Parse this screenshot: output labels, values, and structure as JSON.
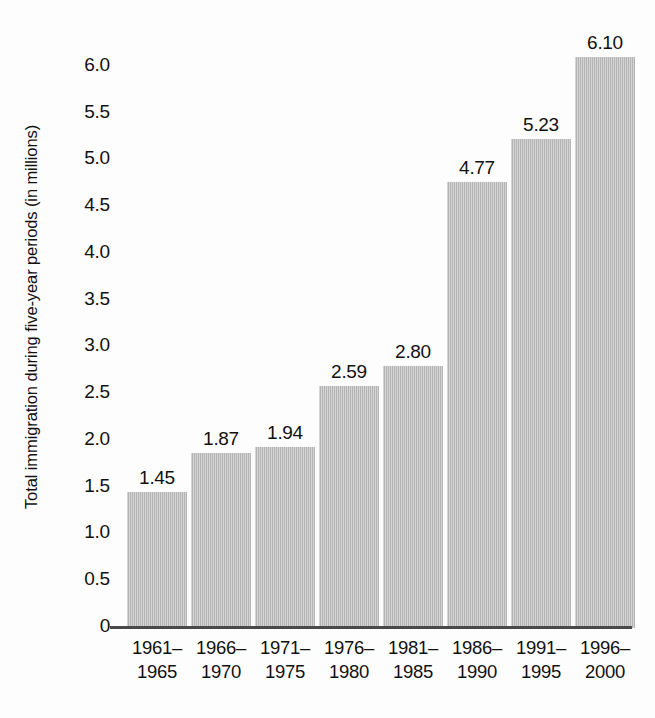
{
  "chart_data": {
    "type": "bar",
    "title": "",
    "subtitle": "",
    "xlabel": "",
    "ylabel": "Total immigration during five-year periods (in millions)",
    "categories": [
      "1961–\n1965",
      "1966–\n1970",
      "1971–\n1975",
      "1976–\n1980",
      "1981–\n1985",
      "1986–\n1990",
      "1991–\n1995",
      "1996–\n2000"
    ],
    "category_lines": [
      [
        "1961–",
        "1965"
      ],
      [
        "1966–",
        "1970"
      ],
      [
        "1971–",
        "1975"
      ],
      [
        "1976–",
        "1980"
      ],
      [
        "1981–",
        "1985"
      ],
      [
        "1986–",
        "1990"
      ],
      [
        "1991–",
        "1995"
      ],
      [
        "1996–",
        "2000"
      ]
    ],
    "values": [
      1.45,
      1.87,
      1.94,
      2.59,
      2.8,
      4.77,
      5.23,
      6.1
    ],
    "value_labels": [
      "1.45",
      "1.87",
      "1.94",
      "2.59",
      "2.80",
      "4.77",
      "5.23",
      "6.10"
    ],
    "ylim": [
      0,
      6.5
    ],
    "ytick_values": [
      0,
      0.5,
      1.0,
      1.5,
      2.0,
      2.5,
      3.0,
      3.5,
      4.0,
      4.5,
      5.0,
      5.5,
      6.0
    ],
    "ytick_labels": [
      "0",
      "0.5",
      "1.0",
      "1.5",
      "2.0",
      "2.5",
      "3.0",
      "3.5",
      "4.0",
      "4.5",
      "5.0",
      "5.5",
      "6.0"
    ],
    "grid": false,
    "legend": null,
    "legend_position": "none",
    "bar_color": "#b9b9b9",
    "axis_color": "#4a4a4a",
    "text_color": "#111111",
    "background_color": "#ffffff"
  }
}
